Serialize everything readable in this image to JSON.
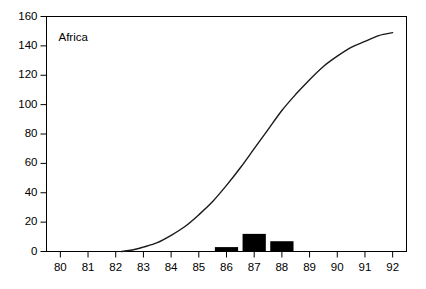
{
  "chart_data": {
    "type": "line",
    "title": "Africa",
    "xlabel": "",
    "ylabel": "",
    "xlim": [
      79.5,
      92.5
    ],
    "ylim": [
      0,
      160
    ],
    "grid": false,
    "legend": "none",
    "x_ticks": [
      "80",
      "81",
      "82",
      "83",
      "84",
      "85",
      "86",
      "87",
      "88",
      "89",
      "90",
      "91",
      "92"
    ],
    "x_tick_values": [
      80,
      81,
      82,
      83,
      84,
      85,
      86,
      87,
      88,
      89,
      90,
      91,
      92
    ],
    "y_ticks": [
      "0",
      "20",
      "40",
      "60",
      "80",
      "100",
      "120",
      "140",
      "160"
    ],
    "y_tick_values": [
      0,
      20,
      40,
      60,
      80,
      100,
      120,
      140,
      160
    ],
    "series": [
      {
        "name": "cumulative-curve",
        "type": "line",
        "color": "#000000",
        "x": [
          82.2,
          82.6,
          83.0,
          83.5,
          84.0,
          84.5,
          85.0,
          85.5,
          86.0,
          86.5,
          87.0,
          87.5,
          88.0,
          88.5,
          89.0,
          89.5,
          90.0,
          90.5,
          91.0,
          91.5,
          92.0
        ],
        "y": [
          0,
          1,
          3,
          6,
          11,
          17,
          25,
          34,
          45,
          57,
          70,
          83,
          96,
          107,
          117,
          126,
          133,
          139,
          143,
          147,
          149
        ]
      },
      {
        "name": "annual-bars",
        "type": "bar",
        "color": "#000000",
        "categories": [
          86,
          87,
          88
        ],
        "values": [
          3,
          12,
          7
        ]
      }
    ]
  },
  "axes": {
    "frame_color": "#000000",
    "background": "#ffffff"
  }
}
